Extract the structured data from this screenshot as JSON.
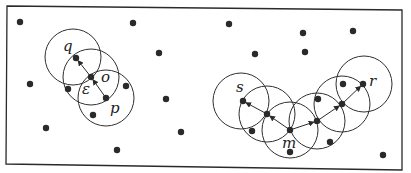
{
  "diagram": {
    "type": "density-reachability-illustration",
    "colors": {
      "background": "#ffffff",
      "stroke": "#2f2f2f",
      "point": "#2a2a2a"
    },
    "frame": {
      "points": "7,6 402,10 402,170 6,164"
    },
    "radius": 28,
    "labels": [
      {
        "id": "q",
        "text": "q",
        "x": 63,
        "y": 51
      },
      {
        "id": "o",
        "text": "o",
        "x": 101,
        "y": 82
      },
      {
        "id": "epsilon",
        "text": "ε",
        "x": 82,
        "y": 94
      },
      {
        "id": "p",
        "text": "p",
        "x": 110,
        "y": 113
      },
      {
        "id": "s",
        "text": "s",
        "x": 236,
        "y": 92
      },
      {
        "id": "m",
        "text": "m",
        "x": 282,
        "y": 148
      },
      {
        "id": "r",
        "text": "r",
        "x": 369,
        "y": 86
      }
    ],
    "circles": [
      {
        "cx": 73,
        "cy": 57
      },
      {
        "cx": 91,
        "cy": 77
      },
      {
        "cx": 106,
        "cy": 98
      },
      {
        "cx": 241,
        "cy": 101
      },
      {
        "cx": 267,
        "cy": 114
      },
      {
        "cx": 290,
        "cy": 130
      },
      {
        "cx": 317,
        "cy": 121
      },
      {
        "cx": 342,
        "cy": 104
      },
      {
        "cx": 364,
        "cy": 84
      }
    ],
    "arrows": [
      {
        "from": [
          106,
          98
        ],
        "to": [
          91,
          77
        ]
      },
      {
        "from": [
          91,
          77
        ],
        "to": [
          76,
          58
        ]
      },
      {
        "from": [
          290,
          130
        ],
        "to": [
          267,
          114
        ]
      },
      {
        "from": [
          267,
          114
        ],
        "to": [
          243,
          101
        ]
      },
      {
        "from": [
          290,
          130
        ],
        "to": [
          317,
          121
        ]
      },
      {
        "from": [
          317,
          121
        ],
        "to": [
          342,
          104
        ]
      },
      {
        "from": [
          342,
          104
        ],
        "to": [
          363,
          84
        ]
      }
    ],
    "points": [
      {
        "x": 76,
        "y": 58,
        "name": "q"
      },
      {
        "x": 91,
        "y": 77,
        "name": "o"
      },
      {
        "x": 106,
        "y": 98,
        "name": "p"
      },
      {
        "x": 243,
        "y": 101,
        "name": "s"
      },
      {
        "x": 267,
        "y": 114,
        "name": "core-s-m"
      },
      {
        "x": 290,
        "y": 130,
        "name": "m"
      },
      {
        "x": 317,
        "y": 121,
        "name": "core-m-r-1"
      },
      {
        "x": 342,
        "y": 104,
        "name": "core-m-r-2"
      },
      {
        "x": 363,
        "y": 84,
        "name": "r"
      },
      {
        "x": 20,
        "y": 22,
        "name": "noise"
      },
      {
        "x": 30,
        "y": 84,
        "name": "noise"
      },
      {
        "x": 46,
        "y": 128,
        "name": "noise"
      },
      {
        "x": 68,
        "y": 89,
        "name": "noise"
      },
      {
        "x": 126,
        "y": 86,
        "name": "noise"
      },
      {
        "x": 93,
        "y": 115,
        "name": "noise"
      },
      {
        "x": 117,
        "y": 150,
        "name": "noise"
      },
      {
        "x": 133,
        "y": 23,
        "name": "noise"
      },
      {
        "x": 159,
        "y": 53,
        "name": "noise"
      },
      {
        "x": 166,
        "y": 99,
        "name": "noise"
      },
      {
        "x": 181,
        "y": 132,
        "name": "noise"
      },
      {
        "x": 229,
        "y": 24,
        "name": "noise"
      },
      {
        "x": 255,
        "y": 54,
        "name": "noise"
      },
      {
        "x": 303,
        "y": 33,
        "name": "noise"
      },
      {
        "x": 305,
        "y": 52,
        "name": "noise"
      },
      {
        "x": 353,
        "y": 31,
        "name": "noise"
      },
      {
        "x": 252,
        "y": 131,
        "name": "noise"
      },
      {
        "x": 290,
        "y": 152,
        "name": "noise"
      },
      {
        "x": 343,
        "y": 84,
        "name": "noise"
      },
      {
        "x": 318,
        "y": 99,
        "name": "noise"
      },
      {
        "x": 330,
        "y": 142,
        "name": "noise"
      },
      {
        "x": 383,
        "y": 155,
        "name": "noise"
      }
    ]
  }
}
